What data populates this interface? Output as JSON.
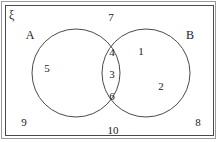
{
  "diagram": {
    "type": "venn",
    "universal_set_symbol": "ξ",
    "sets": [
      {
        "id": "A",
        "label": "A",
        "label_x": 30,
        "label_y": 35
      },
      {
        "id": "B",
        "label": "B",
        "label_x": 190,
        "label_y": 35
      }
    ],
    "circles": [
      {
        "id": "A",
        "cx": 76,
        "cy": 73,
        "r": 44
      },
      {
        "id": "B",
        "cx": 146,
        "cy": 73,
        "r": 44
      }
    ],
    "frame": {
      "outer_color": "#9a9a9a",
      "inner_color": "#4a4a4a",
      "stroke_color": "#4a4a4a"
    },
    "regions": [
      {
        "region": "A-only",
        "elements": [
          {
            "value": "5",
            "x": 47,
            "y": 68
          }
        ]
      },
      {
        "region": "A-intersect-B",
        "elements": [
          {
            "value": "4",
            "x": 112,
            "y": 52
          },
          {
            "value": "3",
            "x": 112,
            "y": 74
          },
          {
            "value": "6",
            "x": 112,
            "y": 96
          }
        ]
      },
      {
        "region": "B-only",
        "elements": [
          {
            "value": "1",
            "x": 141,
            "y": 51
          },
          {
            "value": "2",
            "x": 161,
            "y": 86
          }
        ]
      },
      {
        "region": "outside-both",
        "elements": [
          {
            "value": "7",
            "x": 111,
            "y": 17
          },
          {
            "value": "9",
            "x": 24,
            "y": 122
          },
          {
            "value": "10",
            "x": 113,
            "y": 130
          },
          {
            "value": "8",
            "x": 198,
            "y": 122
          }
        ]
      }
    ]
  },
  "chart_data": {
    "type": "diagram",
    "subtype": "venn-2set",
    "title": "",
    "universal_set": "ξ",
    "set_names": [
      "A",
      "B"
    ],
    "A_only": [
      "5"
    ],
    "intersection": [
      "4",
      "3",
      "6"
    ],
    "B_only": [
      "1",
      "2"
    ],
    "outside": [
      "7",
      "9",
      "10",
      "8"
    ],
    "all_elements": [
      "1",
      "2",
      "3",
      "4",
      "5",
      "6",
      "7",
      "8",
      "9",
      "10"
    ]
  }
}
